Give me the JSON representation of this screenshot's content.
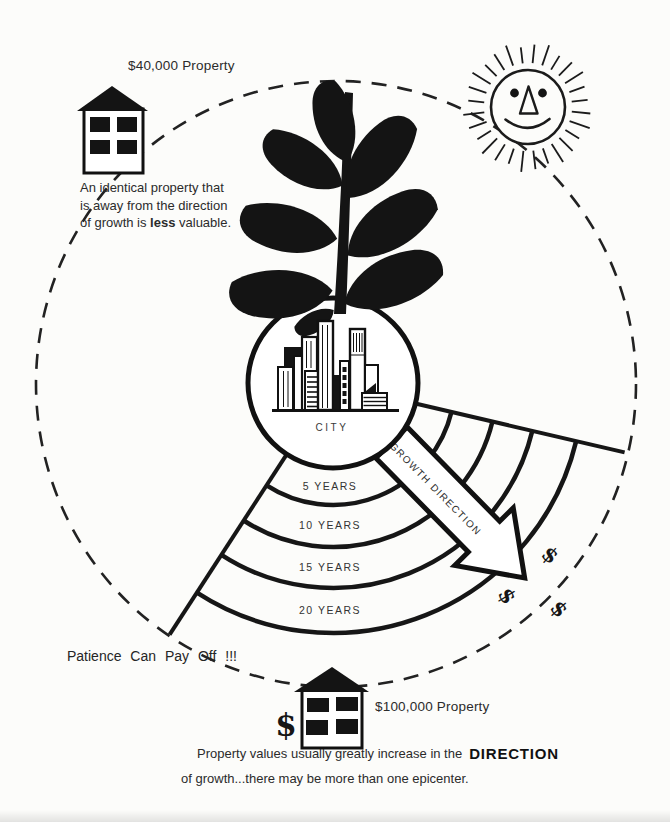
{
  "colors": {
    "ink": "#1b1b1b",
    "paper": "#fcfcfa"
  },
  "top_left": {
    "price_label": "$40,000 Property",
    "caption_line1": "An identical property that",
    "caption_line2": "is away from the direction",
    "caption_line3_pre": "of growth is ",
    "caption_line3_bold": "less",
    "caption_line3_post": " valuable."
  },
  "center": {
    "city_label": "CITY",
    "growth_arrow_label": "GROWTH DIRECTION",
    "year_rings": [
      "5 YEARS",
      "10 YEARS",
      "15 YEARS",
      "20 YEARS"
    ],
    "dollar_signs": [
      "$",
      "$",
      "$"
    ]
  },
  "bottom": {
    "patience_label": "Patience Can Pay Off !!!",
    "house_dollar": "$",
    "price_label": "$100,000 Property",
    "caption_line1_pre": "Property values usually greatly increase in the",
    "caption_line1_bold": "DIRECTION",
    "caption_line2": "of growth...there may be more than one epicenter."
  },
  "icons": {
    "sun": "sun-icon",
    "plant": "growth-plant-icon",
    "city": "city-skyline-icon",
    "house_top": "house-icon",
    "house_bottom": "house-icon",
    "arrow": "growth-direction-arrow"
  }
}
